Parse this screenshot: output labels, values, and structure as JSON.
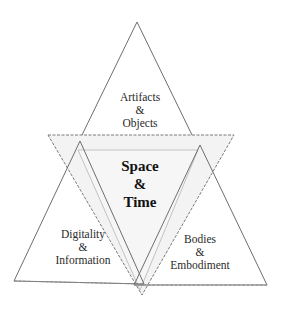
{
  "diagram": {
    "center": {
      "line1": "Space",
      "line2": "&",
      "line3": "Time"
    },
    "top": {
      "line1": "Artifacts",
      "line2": "&",
      "line3": "Objects"
    },
    "left": {
      "line1": "Digitality",
      "line2": "&",
      "line3": "Information"
    },
    "right": {
      "line1": "Bodies",
      "line2": "&",
      "line3": "Embodiment"
    }
  },
  "colors": {
    "stroke": "#6e6e6e",
    "center_fill": "#f2f2f2",
    "inner_stroke": "#bdbdbd"
  }
}
